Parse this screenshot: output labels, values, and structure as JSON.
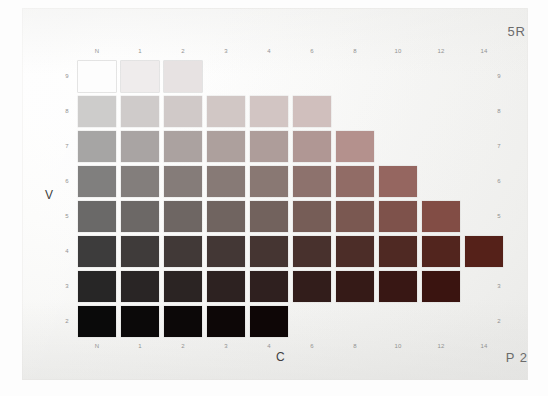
{
  "page": {
    "hue_label": "5R",
    "page_label": "P 2",
    "value_axis_label": "V",
    "chroma_axis_label": "C",
    "card_background": "#f6f6f4",
    "ink_color": "#8b8b8b"
  },
  "chart_data": {
    "type": "heatmap",
    "title": "5R",
    "xlabel": "C",
    "ylabel": "V",
    "x_tick_labels": [
      "N",
      "1",
      "2",
      "3",
      "4",
      "6",
      "8",
      "10",
      "12",
      "14"
    ],
    "x_values": [
      0,
      1,
      2,
      3,
      4,
      6,
      8,
      10,
      12,
      14
    ],
    "y_tick_labels": [
      "9",
      "8",
      "7",
      "6",
      "5",
      "4",
      "3",
      "2"
    ],
    "y_values": [
      9,
      8,
      7,
      6,
      5,
      4,
      3,
      2
    ],
    "grid": false,
    "legend": "none",
    "rows": [
      {
        "value": 9,
        "chroma_count": 3,
        "chromas": [
          0,
          1,
          2
        ],
        "colors": [
          "#fdfdfd",
          "#efecec",
          "#e7e2e2"
        ]
      },
      {
        "value": 8,
        "chroma_count": 6,
        "chromas": [
          0,
          1,
          2,
          3,
          4,
          6
        ],
        "colors": [
          "#cdcccb",
          "#cfcbca",
          "#d0c9c8",
          "#d1c7c5",
          "#d2c5c3",
          "#d0bfbd"
        ]
      },
      {
        "value": 7,
        "chroma_count": 7,
        "chromas": [
          0,
          1,
          2,
          3,
          4,
          6,
          8
        ],
        "colors": [
          "#a6a5a4",
          "#a9a4a3",
          "#aba2a0",
          "#ada09d",
          "#ae9d9a",
          "#b09794",
          "#b4918d"
        ]
      },
      {
        "value": 6,
        "chroma_count": 8,
        "chromas": [
          0,
          1,
          2,
          3,
          4,
          6,
          8,
          10
        ],
        "colors": [
          "#807f7e",
          "#837e7c",
          "#857c79",
          "#877a76",
          "#897873",
          "#8d726d",
          "#916c66",
          "#956660"
        ]
      },
      {
        "value": 5,
        "chroma_count": 9,
        "chromas": [
          0,
          1,
          2,
          3,
          4,
          6,
          8,
          10,
          12
        ],
        "colors": [
          "#6a6968",
          "#6c6866",
          "#6e6663",
          "#706460",
          "#72625d",
          "#765d57",
          "#7a5851",
          "#7e524b",
          "#824d45"
        ]
      },
      {
        "value": 4,
        "chroma_count": 10,
        "chromas": [
          0,
          1,
          2,
          3,
          4,
          6,
          8,
          10,
          12,
          14
        ],
        "colors": [
          "#3d3c3c",
          "#3f3b3a",
          "#413937",
          "#433735",
          "#453532",
          "#48312d",
          "#4c2d28",
          "#4f2923",
          "#52251e",
          "#552119"
        ]
      },
      {
        "value": 3,
        "chroma_count": 9,
        "chromas": [
          0,
          1,
          2,
          3,
          4,
          6,
          8,
          10,
          12
        ],
        "colors": [
          "#272626",
          "#292525",
          "#2b2423",
          "#2d2221",
          "#2f201f",
          "#321d1b",
          "#351a17",
          "#381714",
          "#3a1410"
        ]
      },
      {
        "value": 2,
        "chroma_count": 5,
        "chromas": [
          0,
          1,
          2,
          3,
          4
        ],
        "colors": [
          "#0a0a0a",
          "#0b0909",
          "#0c0808",
          "#0d0707",
          "#0e0606"
        ]
      }
    ]
  }
}
